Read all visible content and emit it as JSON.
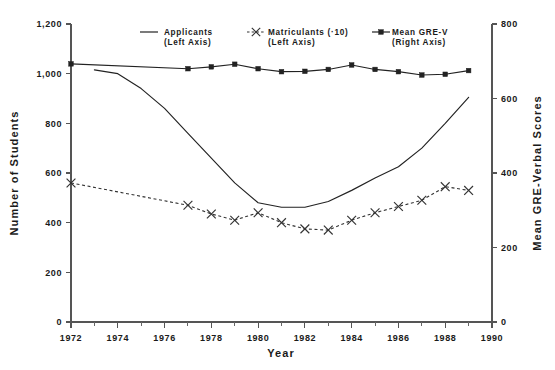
{
  "chart_data": {
    "type": "line",
    "title": "",
    "xlabel": "Year",
    "ylabel": "Number of Students",
    "y2label": "Mean GRE-Verbal Scores",
    "xlim": [
      1972,
      1990
    ],
    "ylim": [
      0,
      1200
    ],
    "y2lim": [
      0,
      800
    ],
    "grid": false,
    "legend_position": "top-center-inside",
    "x_ticks_major": [
      "1972",
      "1974",
      "1976",
      "1978",
      "1980",
      "1982",
      "1984",
      "1986",
      "1988",
      "1990"
    ],
    "x_ticks_major_values": [
      1972,
      1974,
      1976,
      1978,
      1980,
      1982,
      1984,
      1986,
      1988,
      1990
    ],
    "x_ticks_minor_values": [
      1973,
      1975,
      1977,
      1979,
      1981,
      1983,
      1985,
      1987,
      1989
    ],
    "y_ticks_left": [
      "0",
      "200",
      "400",
      "600",
      "800",
      "1,000",
      "1,200"
    ],
    "y_ticks_left_values": [
      0,
      200,
      400,
      600,
      800,
      1000,
      1200
    ],
    "y_ticks_right": [
      "0",
      "200",
      "400",
      "600",
      "800"
    ],
    "y_ticks_right_values": [
      0,
      200,
      400,
      600,
      800
    ],
    "series": [
      {
        "name": "Applicants",
        "legend_label_line1": "Applicants",
        "legend_label_line2": "(Left Axis)",
        "axis": "left",
        "style": "solid",
        "marker": "none",
        "color": "#222222",
        "x": [
          1973,
          1974,
          1975,
          1976,
          1977,
          1978,
          1979,
          1980,
          1981,
          1982,
          1983,
          1984,
          1985,
          1986,
          1987,
          1988,
          1989
        ],
        "values": [
          1015,
          1000,
          940,
          860,
          760,
          660,
          560,
          480,
          462,
          462,
          485,
          530,
          580,
          625,
          700,
          800,
          905
        ]
      },
      {
        "name": "Matriculants (·10)",
        "legend_label_line1": "Matriculants (·10)",
        "legend_label_line2": "(Left Axis)",
        "axis": "left",
        "style": "dashed",
        "marker": "x",
        "color": "#333333",
        "x": [
          1972,
          1977,
          1978,
          1979,
          1980,
          1981,
          1982,
          1983,
          1984,
          1985,
          1986,
          1987,
          1988,
          1989
        ],
        "values": [
          560,
          470,
          435,
          410,
          440,
          400,
          375,
          370,
          410,
          440,
          465,
          490,
          545,
          530
        ]
      },
      {
        "name": "Mean GRE-V",
        "legend_label_line1": "Mean GRE-V",
        "legend_label_line2": "(Right Axis)",
        "axis": "right",
        "style": "solid",
        "marker": "square",
        "color": "#222222",
        "x": [
          1972,
          1977,
          1978,
          1979,
          1980,
          1981,
          1982,
          1983,
          1984,
          1985,
          1986,
          1987,
          1988,
          1989
        ],
        "values": [
          693,
          680,
          685,
          692,
          680,
          672,
          673,
          678,
          690,
          678,
          672,
          663,
          665,
          675
        ]
      }
    ]
  },
  "legend": {
    "items": [
      {
        "label_line1": "Applicants",
        "label_line2": "(Left Axis)",
        "sample": "solid-line"
      },
      {
        "label_line1": "Matriculants (·10)",
        "label_line2": "(Left Axis)",
        "sample": "dashed-x"
      },
      {
        "label_line1": "Mean GRE-V",
        "label_line2": "(Right Axis)",
        "sample": "solid-square"
      }
    ]
  },
  "axes": {
    "left_title": "Number of Students",
    "right_title": "Mean GRE-Verbal Scores",
    "bottom_title": "Year"
  }
}
